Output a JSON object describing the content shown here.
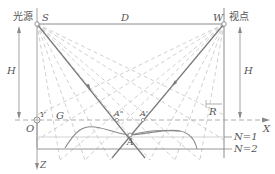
{
  "labels": {
    "light_source": "光源",
    "viewpoint": "视点",
    "S": "S",
    "D": "D",
    "W": "W",
    "H_left": "H",
    "H_right": "H",
    "O": "O",
    "Y": "Y",
    "G": "G",
    "A_double_prime": "A\"",
    "A_prime": "A'",
    "A": "A",
    "R": "R",
    "X": "X",
    "Z": "Z",
    "N1": "N=1",
    "N2": "N=2"
  },
  "colors": {
    "line": "#8a8a8a",
    "dashed": "#bdbdbd",
    "curve": "#8a8a8a",
    "text": "#555555"
  }
}
